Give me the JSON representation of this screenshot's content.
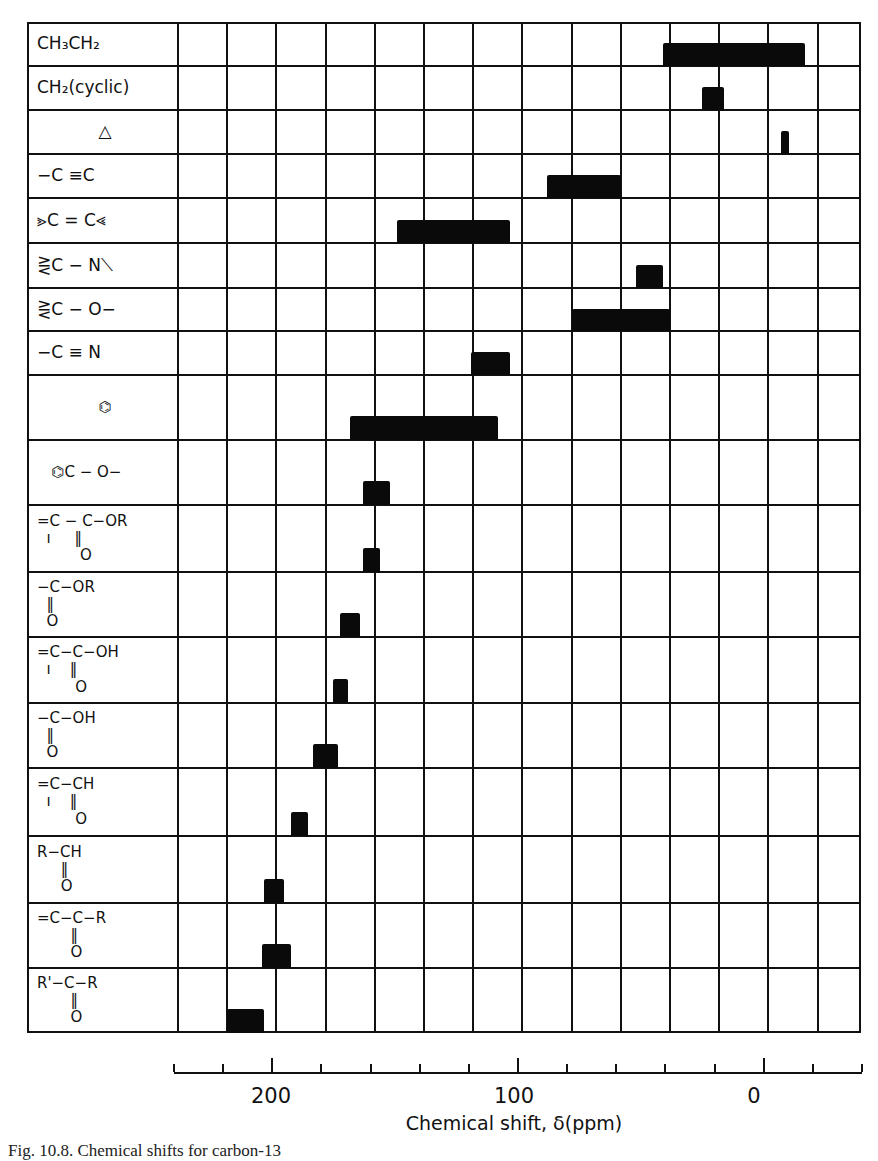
{
  "chart_data": {
    "type": "bar",
    "subtype": "horizontal-range",
    "title": "",
    "xlabel": "Chemical shift, δ(ppm)",
    "ylabel": "",
    "xlim": [
      240,
      -40
    ],
    "x_reversed": true,
    "grid": true,
    "x_ticks": [
      240,
      220,
      200,
      180,
      160,
      140,
      120,
      100,
      80,
      60,
      40,
      20,
      0,
      -20,
      -40
    ],
    "x_tick_labels": [
      {
        "value": 200,
        "label": "200"
      },
      {
        "value": 100,
        "label": "100"
      },
      {
        "value": 0,
        "label": "0"
      }
    ],
    "categories": [
      "CH3CH2",
      "CH2(cyclic)",
      "△",
      "−C≡C",
      ">C=C<",
      "≥C−N<",
      "≥C−O−",
      "−C≡N",
      "benzene ring",
      "aryl C−O−",
      "=C−C(=O)−OR",
      "−C(=O)−OR",
      "=C−C(=O)−OH",
      "−C(=O)−OH",
      "=C−C(=O)H",
      "R−C(=O)H",
      "=C−C(=O)−R",
      "R'−C(=O)−R"
    ],
    "ranges": [
      {
        "category": "CH3CH2",
        "from": 43,
        "to": -15
      },
      {
        "category": "CH2(cyclic)",
        "from": 27,
        "to": 18
      },
      {
        "category": "△",
        "from": -5,
        "to": -8
      },
      {
        "category": "−C≡C",
        "from": 90,
        "to": 60
      },
      {
        "category": ">C=C<",
        "from": 151,
        "to": 105
      },
      {
        "category": "≥C−N<",
        "from": 54,
        "to": 43
      },
      {
        "category": "≥C−O−",
        "from": 80,
        "to": 40
      },
      {
        "category": "−C≡N",
        "from": 121,
        "to": 105
      },
      {
        "category": "benzene ring",
        "from": 170,
        "to": 110
      },
      {
        "category": "aryl C−O−",
        "from": 165,
        "to": 154
      },
      {
        "category": "=C−C(=O)−OR",
        "from": 165,
        "to": 158
      },
      {
        "category": "−C(=O)−OR",
        "from": 174,
        "to": 166
      },
      {
        "category": "=C−C(=O)−OH",
        "from": 177,
        "to": 171
      },
      {
        "category": "−C(=O)−OH",
        "from": 185,
        "to": 175
      },
      {
        "category": "=C−C(=O)H",
        "from": 194,
        "to": 187
      },
      {
        "category": "R−C(=O)H",
        "from": 205,
        "to": 197
      },
      {
        "category": "=C−C(=O)−R",
        "from": 206,
        "to": 194
      },
      {
        "category": "R'−C(=O)−R",
        "from": 220,
        "to": 205
      }
    ]
  },
  "rows": [
    {
      "label": "CH₃CH₂",
      "top": 22,
      "bottom": 66
    },
    {
      "label": "CH₂(cyclic)",
      "top": 66,
      "bottom": 110
    },
    {
      "label": "△",
      "top": 110,
      "bottom": 154,
      "center": true
    },
    {
      "label": "−C ≡C",
      "top": 154,
      "bottom": 198
    },
    {
      "label": "⪢C = C⪡",
      "top": 198,
      "bottom": 243
    },
    {
      "label": "⋛C − N⟍",
      "top": 243,
      "bottom": 288
    },
    {
      "label": "⋛C − O−",
      "top": 288,
      "bottom": 331
    },
    {
      "label": "−C ≡ N",
      "top": 331,
      "bottom": 375
    },
    {
      "label": "⌬",
      "top": 375,
      "bottom": 440,
      "center": true
    },
    {
      "label": "   ⌬C − O−",
      "top": 440,
      "bottom": 505
    },
    {
      "label": "=C − C−OR\n  ı     ‖\n         O",
      "top": 505,
      "bottom": 572
    },
    {
      "label": "−C−OR\n  ‖\n  O",
      "top": 572,
      "bottom": 637
    },
    {
      "label": "=C−C−OH\n  ı    ‖\n        O",
      "top": 637,
      "bottom": 703
    },
    {
      "label": "−C−OH\n  ‖\n  O",
      "top": 703,
      "bottom": 768
    },
    {
      "label": "=C−CH\n  ı    ‖\n        O",
      "top": 768,
      "bottom": 836
    },
    {
      "label": "R−CH\n     ‖\n     O",
      "top": 836,
      "bottom": 903
    },
    {
      "label": "=C−C−R\n       ‖\n       O",
      "top": 903,
      "bottom": 968
    },
    {
      "label": "R'−C−R\n       ‖\n       O",
      "top": 968,
      "bottom": 1033
    }
  ],
  "axis": {
    "label": "Chemical shift, δ(ppm)",
    "tick_labels": [
      "200",
      "100",
      "0"
    ]
  },
  "caption": "Fig. 10.8.  Chemical shifts for carbon-13"
}
